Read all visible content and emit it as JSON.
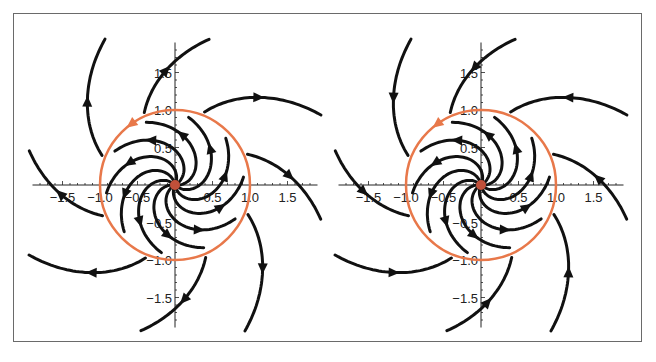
{
  "chart_data": [
    {
      "type": "line",
      "title": "",
      "subtitle": "Phase portrait (left): trajectories spiral outward from the origin; limit cycle r = 1 shown in orange; outer trajectories move away",
      "xlabel": "",
      "ylabel": "",
      "xlim": [
        -1.9,
        1.9
      ],
      "ylim": [
        -1.9,
        1.9
      ],
      "x_ticks": [
        "-1.5",
        "-1.0",
        "-0.5",
        "0.5",
        "1.0",
        "1.5"
      ],
      "y_ticks": [
        "1.5",
        "1.0",
        "0.5",
        "-0.5",
        "-1.0",
        "-1.5"
      ],
      "grid": false,
      "limit_cycle": {
        "radius": 1.0,
        "color": "#E8784A",
        "direction": "counterclockwise"
      },
      "fixed_point": {
        "x": 0,
        "y": 0,
        "color": "#C0503A"
      },
      "flow": "outer trajectories leave the circle; inner spirals converge to the circle",
      "series": [
        {
          "name": "inner spirals",
          "count": 10,
          "color": "#111111"
        },
        {
          "name": "outer trajectories",
          "count": 8,
          "color": "#111111"
        }
      ]
    },
    {
      "type": "line",
      "title": "",
      "subtitle": "Phase portrait (right): trajectories approach the limit cycle r = 1 from outside",
      "xlabel": "",
      "ylabel": "",
      "xlim": [
        -1.9,
        1.9
      ],
      "ylim": [
        -1.9,
        1.9
      ],
      "x_ticks": [
        "-1.5",
        "-1.0",
        "-0.5",
        "0.5",
        "1.0",
        "1.5"
      ],
      "y_ticks": [
        "1.5",
        "1.0",
        "0.5",
        "-0.5",
        "-1.0",
        "-1.5"
      ],
      "grid": false,
      "limit_cycle": {
        "radius": 1.0,
        "color": "#E8784A",
        "direction": "counterclockwise"
      },
      "fixed_point": {
        "x": 0,
        "y": 0,
        "color": "#C0503A"
      },
      "flow": "outer trajectories approach the circle; inner spirals emanate from origin",
      "series": [
        {
          "name": "inner spirals",
          "count": 10,
          "color": "#111111"
        },
        {
          "name": "outer trajectories",
          "count": 8,
          "color": "#111111"
        }
      ]
    }
  ],
  "plots": {
    "left": {
      "cx": 175,
      "cy": 185,
      "scale": 75,
      "outer_sign": -1
    },
    "right": {
      "cx": 481,
      "cy": 185,
      "scale": 75,
      "outer_sign": 1
    }
  },
  "colors": {
    "frame": "#6a6a6a",
    "axis": "#222222",
    "curve": "#111111",
    "cycle": "#E8784A",
    "origin": "#C0503A"
  }
}
